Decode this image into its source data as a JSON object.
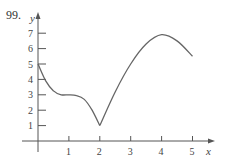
{
  "problem_number": "99.",
  "chart_data": {
    "type": "line",
    "title": "",
    "xlabel": "x",
    "ylabel": "y",
    "xlim": [
      0,
      5
    ],
    "ylim": [
      0,
      7
    ],
    "x_ticks": [
      1,
      2,
      3,
      4,
      5
    ],
    "y_ticks": [
      1,
      2,
      3,
      4,
      5,
      6,
      7
    ],
    "grid": false,
    "legend": null,
    "series": [
      {
        "name": "f(x)",
        "x": [
          0,
          0.25,
          0.5,
          0.75,
          1.0,
          1.25,
          1.5,
          1.75,
          2.0,
          2.5,
          3.0,
          3.5,
          4.0,
          4.5,
          5.0
        ],
        "values": [
          5.0,
          3.9,
          3.25,
          3.0,
          3.0,
          2.95,
          2.7,
          2.0,
          1.0,
          3.2,
          5.0,
          6.3,
          6.9,
          6.5,
          5.5
        ]
      }
    ],
    "annotations": [
      "local minimum near (2, 1) with a sharp corner",
      "local maximum near (4, 7)"
    ]
  }
}
